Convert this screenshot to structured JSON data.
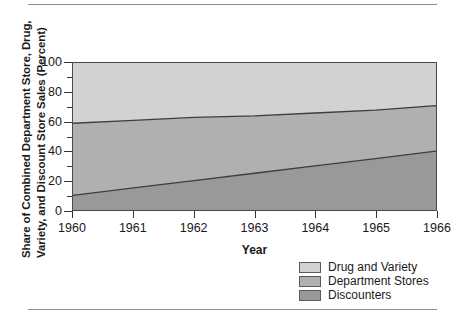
{
  "figure": {
    "rule_top": "",
    "rule_bottom": ""
  },
  "axes": {
    "y_title_line1": "Share of Combined Department Store, Drug,",
    "y_title_line2": "Variety, and Discount Store Sales (Percent)",
    "x_title": "Year",
    "y_ticks": [
      "0",
      "20",
      "40",
      "60",
      "80",
      "100"
    ],
    "x_ticks": [
      "1960",
      "1961",
      "1962",
      "1963",
      "1964",
      "1965",
      "1966"
    ]
  },
  "legend": {
    "items": [
      {
        "label": "Drug and Variety",
        "color": "#d2d2d2"
      },
      {
        "label": "Department Stores",
        "color": "#b0b0b0"
      },
      {
        "label": "Discounters",
        "color": "#999999"
      }
    ]
  },
  "chart_data": {
    "type": "area",
    "title": "",
    "subtitle": "",
    "xlabel": "Year",
    "ylabel": "Share of Combined Department Store, Drug, Variety, and Discount Store Sales (Percent)",
    "stacked": true,
    "grid": false,
    "legend_position": "bottom-right",
    "x": [
      1960,
      1961,
      1962,
      1963,
      1964,
      1965,
      1966
    ],
    "xlim": [
      1960,
      1966
    ],
    "ylim": [
      0,
      100
    ],
    "y_tick_values": [
      0,
      20,
      40,
      60,
      80,
      100
    ],
    "y_minor_tick_values": [
      10,
      30,
      50,
      70,
      90
    ],
    "series": [
      {
        "name": "Discounters",
        "color": "#999999",
        "values": [
          10,
          15,
          20,
          25,
          30,
          35,
          40
        ],
        "cumulative_top": [
          10,
          15,
          20,
          25,
          30,
          35,
          40
        ]
      },
      {
        "name": "Department Stores",
        "color": "#b0b0b0",
        "values": [
          49,
          47,
          45,
          43,
          41,
          39,
          31
        ],
        "cumulative_top": [
          59,
          61,
          63,
          64,
          66,
          68,
          71
        ]
      },
      {
        "name": "Drug and Variety",
        "color": "#d2d2d2",
        "values": [
          41,
          39,
          37,
          36,
          34,
          32,
          29
        ],
        "cumulative_top": [
          100,
          100,
          100,
          100,
          100,
          100,
          100
        ]
      }
    ],
    "boundaries": {
      "discounters_top": [
        10,
        15,
        20,
        25,
        30,
        35,
        40
      ],
      "department_stores_top": [
        59,
        61,
        63,
        64,
        66,
        68,
        71
      ]
    }
  }
}
